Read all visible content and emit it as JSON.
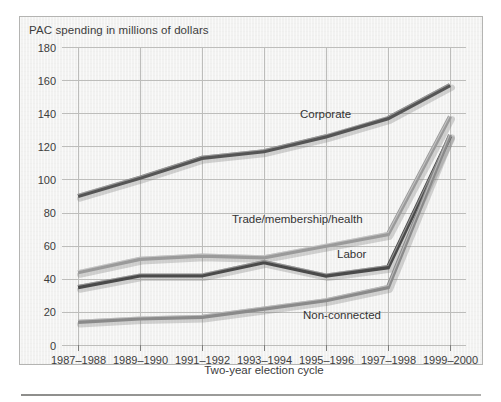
{
  "chart_data": {
    "type": "line",
    "title": "PAC spending in millions of dollars",
    "xlabel": "Two-year election cycle",
    "ylabel": "PAC spending in millions of dollars",
    "categories": [
      "1987–1988",
      "1989–1990",
      "1991–1992",
      "1993–1994",
      "1995–1996",
      "1997–1998",
      "1999–2000"
    ],
    "ylim": [
      0,
      180
    ],
    "yticks": [
      0,
      20,
      40,
      60,
      80,
      100,
      120,
      140,
      160,
      180
    ],
    "grid": true,
    "legend_position": "inline-annotations",
    "series": [
      {
        "name": "Corporate",
        "color": "#555555",
        "values": [
          90,
          101,
          113,
          117,
          126,
          137,
          157
        ]
      },
      {
        "name": "Trade/membership/health",
        "color": "#9a9a9a",
        "values": [
          44,
          52,
          54,
          53,
          60,
          67,
          138
        ]
      },
      {
        "name": "Labor",
        "color": "#4a4a4a",
        "values": [
          35,
          42,
          42,
          50,
          42,
          47,
          126
        ]
      },
      {
        "name": "Non-connected",
        "color": "#8a8a8a",
        "values": [
          14,
          16,
          17,
          22,
          27,
          35,
          127
        ]
      }
    ],
    "annotations": [
      {
        "text": "Corporate",
        "x": 300,
        "y": 118
      },
      {
        "text": "Trade/membership/health",
        "x": 232,
        "y": 223
      },
      {
        "text": "Labor",
        "x": 337,
        "y": 258
      },
      {
        "text": "Non-connected",
        "x": 303,
        "y": 319
      }
    ]
  },
  "axis_tick_labels": {
    "y": [
      "180",
      "160",
      "140",
      "120",
      "100",
      "80",
      "60",
      "40",
      "20",
      "0"
    ],
    "x": [
      "1987–1988",
      "1989–1990",
      "1991–1992",
      "1993–1994",
      "1995–1996",
      "1997–1998",
      "1999–2000"
    ]
  },
  "colors": {
    "panel_background": "#f2f2f1",
    "panel_border": "#b4b4b2",
    "gridline": "#bdbdbb",
    "text": "#3c3c3c",
    "page_background": "#ffffff",
    "footer_rule": "#8d8d8b"
  }
}
